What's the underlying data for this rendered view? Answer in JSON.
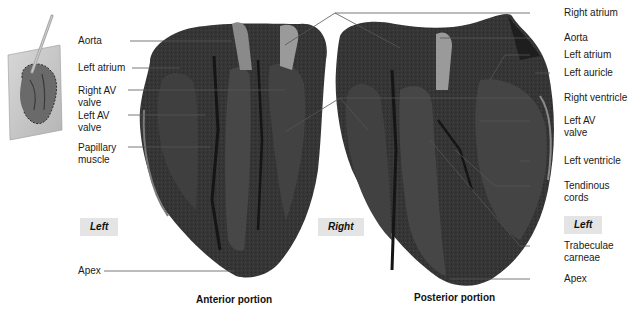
{
  "figure": {
    "type": "anatomical-photograph",
    "inset": {
      "icon": "heart-with-cutting-plane-icon"
    },
    "panels": [
      {
        "id": "anterior",
        "caption": "Anterior portion"
      },
      {
        "id": "posterior",
        "caption": "Posterior portion"
      }
    ],
    "side_tags": {
      "left_anterior": "Left",
      "right_middle": "Right",
      "left_posterior": "Left"
    },
    "labels_left": [
      {
        "text": "Aorta"
      },
      {
        "text": "Left atrium"
      },
      {
        "text": "Right AV\nvalve"
      },
      {
        "text": "Left AV\nvalve"
      },
      {
        "text": "Papillary\nmuscle"
      },
      {
        "text": "Apex"
      }
    ],
    "labels_right": [
      {
        "text": "Right atrium"
      },
      {
        "text": "Aorta"
      },
      {
        "text": "Left atrium"
      },
      {
        "text": "Left auricle"
      },
      {
        "text": "Right ventricle"
      },
      {
        "text": "Left AV\nvalve"
      },
      {
        "text": "Left ventricle"
      },
      {
        "text": "Tendinous\ncords"
      },
      {
        "text": "Trabeculae\ncarneae"
      },
      {
        "text": "Apex"
      }
    ],
    "colors": {
      "tissue_dark": "#2e2e2e",
      "tissue_mid": "#4a4a4a",
      "tissue_light": "#9a9a9a",
      "leader_line": "#555555",
      "tag_bg": "#e4e4e4"
    }
  }
}
